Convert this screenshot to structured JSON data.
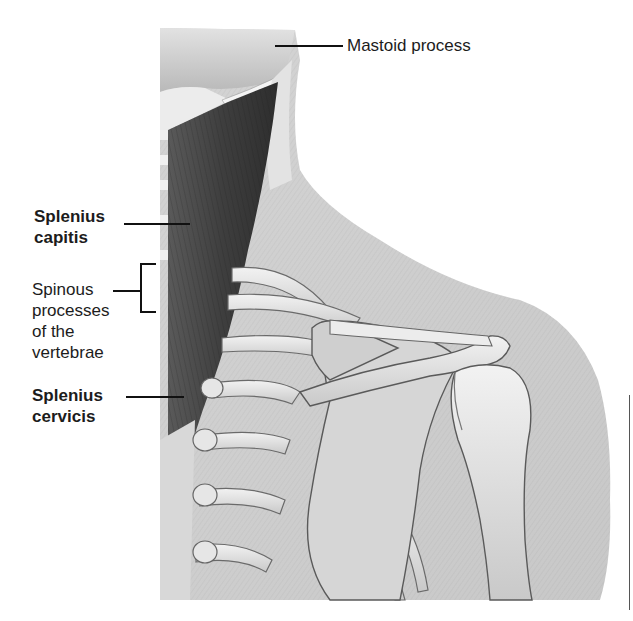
{
  "figure": {
    "labels": {
      "mastoid_process": "Mastoid process",
      "splenius_capitis_line1": "Splenius",
      "splenius_capitis_line2": "capitis",
      "spinous_line1": "Spinous",
      "spinous_line2": "processes",
      "spinous_line3": "of the",
      "spinous_line4": "vertebrae",
      "splenius_cervicis_line1": "Splenius",
      "splenius_cervicis_line2": "cervicis"
    },
    "colors": {
      "background": "#ffffff",
      "skin": "#dcdcdc",
      "muscle": "#4a4a4a",
      "bone": "#e8e8e8",
      "line": "#111111"
    }
  }
}
